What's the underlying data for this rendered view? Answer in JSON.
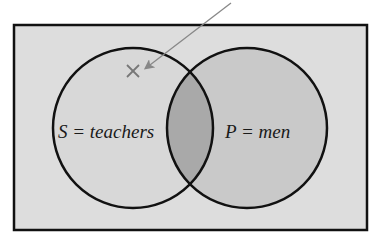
{
  "diagram": {
    "type": "venn",
    "caption_cropped": true,
    "caption": "",
    "universe": {
      "fill": "#dddddd",
      "stroke": "#111111"
    },
    "sets": [
      {
        "id": "S",
        "label": "S = teachers",
        "letter": "S",
        "meaning": "teachers",
        "fill": "#d8d8d8"
      },
      {
        "id": "P",
        "label": "P = men",
        "letter": "P",
        "meaning": "men",
        "fill": "#c9c9c9"
      }
    ],
    "intersection": {
      "fill": "#a9a9a9"
    },
    "marker": {
      "symbol": "×",
      "region": "S only (outside P)",
      "color": "#777777"
    },
    "pointer": {
      "color": "#888888"
    }
  }
}
